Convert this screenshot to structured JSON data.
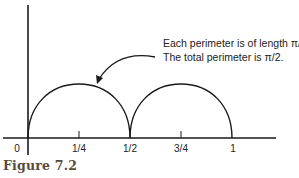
{
  "diagram": {
    "annotation": {
      "line1": "Each perimeter is of length π/4.",
      "line2": "The total perimeter is π/2."
    },
    "x_axis": {
      "ticks": [
        {
          "label": "0",
          "value": 0
        },
        {
          "label": "1/4",
          "value": 0.25
        },
        {
          "label": "1/2",
          "value": 0.5
        },
        {
          "label": "3/4",
          "value": 0.75
        },
        {
          "label": "1",
          "value": 1
        }
      ]
    },
    "arcs": [
      {
        "from": 0,
        "to": 0.5,
        "shape": "semicircle"
      },
      {
        "from": 0.5,
        "to": 1,
        "shape": "semicircle"
      }
    ],
    "arrow": {
      "points_to": "arc-1",
      "from": "annotation"
    },
    "line_color": "#1a1a1a"
  },
  "caption": "Figure 7.2"
}
